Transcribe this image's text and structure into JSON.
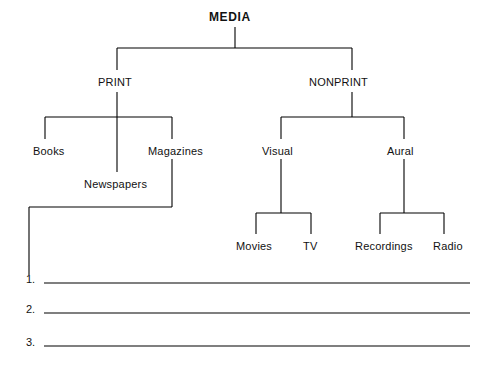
{
  "diagram": {
    "type": "tree",
    "root": {
      "label": "MEDIA",
      "x": 209,
      "y": 10
    },
    "nodes": [
      {
        "id": "print",
        "label": "PRINT",
        "x": 98,
        "y": 76
      },
      {
        "id": "nonprint",
        "label": "NONPRINT",
        "x": 309,
        "y": 76
      },
      {
        "id": "books",
        "label": "Books",
        "x": 33,
        "y": 145
      },
      {
        "id": "newspapers",
        "label": "Newspapers",
        "x": 84,
        "y": 178
      },
      {
        "id": "magazines",
        "label": "Magazines",
        "x": 148,
        "y": 145
      },
      {
        "id": "visual",
        "label": "Visual",
        "x": 262,
        "y": 145
      },
      {
        "id": "aural",
        "label": "Aural",
        "x": 387,
        "y": 145
      },
      {
        "id": "movies",
        "label": "Movies",
        "x": 236,
        "y": 240
      },
      {
        "id": "tv",
        "label": "TV",
        "x": 303,
        "y": 240
      },
      {
        "id": "recordings",
        "label": "Recordings",
        "x": 355,
        "y": 240
      },
      {
        "id": "radio",
        "label": "Radio",
        "x": 433,
        "y": 240
      }
    ],
    "blanks": [
      {
        "number": "1.",
        "x": 26,
        "y": 273,
        "line_x1": 44,
        "line_x2": 470,
        "line_y": 283
      },
      {
        "number": "2.",
        "x": 26,
        "y": 303,
        "line_x1": 44,
        "line_x2": 470,
        "line_y": 313
      },
      {
        "number": "3.",
        "x": 26,
        "y": 336,
        "line_x1": 44,
        "line_x2": 470,
        "line_y": 346
      }
    ],
    "line_color": "#000000"
  }
}
